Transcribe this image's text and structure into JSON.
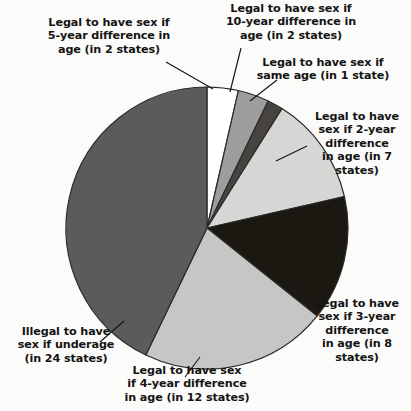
{
  "chart_data": {
    "type": "pie",
    "title": "",
    "subtitle": "",
    "xlabel": "",
    "ylabel": "",
    "legend_position": "none",
    "grid": false,
    "unit": "states",
    "total": 56,
    "center": {
      "cx": 207,
      "cy": 228,
      "r": 141
    },
    "start_angle_deg": 0,
    "direction": "clockwise",
    "categories": [
      "Legal to have sex if 5-year difference in age (in 2 states)",
      "Legal to have sex if 10-year difference in age (in 2 states)",
      "Legal to have sex if same age (in 1 state)",
      "Legal to have sex if 2-year difference in age (in 7 states)",
      "Legal to have sex if 3-year difference in age (in 8 states)",
      "Legal to have sex if 4-year difference in age (in 12 states)",
      "Illegal to have sex if underage (in 24 states)"
    ],
    "values": [
      2,
      2,
      1,
      7,
      8,
      12,
      24
    ],
    "slices": [
      {
        "key": "five-year",
        "label": "Legal to have sex if\n5-year difference in\nage (in 2 states)",
        "value": 2,
        "start_deg": 0,
        "end_deg": 12.86,
        "color": "#ffffff",
        "leader": {
          "x1": 166,
          "y1": 62,
          "x2": 213,
          "y2": 89
        }
      },
      {
        "key": "ten-year",
        "label": "Legal to have sex if\n10-year difference in\nage (in 2 states)",
        "value": 2,
        "start_deg": 12.86,
        "end_deg": 25.71,
        "color": "#9d9d9d",
        "leader": {
          "x1": 241,
          "y1": 48,
          "x2": 230,
          "y2": 92
        }
      },
      {
        "key": "same-age",
        "label": "Legal to have sex if\nsame age (in 1 state)",
        "value": 1,
        "start_deg": 25.71,
        "end_deg": 32.14,
        "color": "#474440",
        "leader": {
          "x1": 277,
          "y1": 80,
          "x2": 250,
          "y2": 101
        }
      },
      {
        "key": "two-year",
        "label": "Legal to have\nsex if 2-year\ndifference\nin age (in 7\nstates)",
        "value": 7,
        "start_deg": 32.14,
        "end_deg": 77.14,
        "color": "#d6d6d4",
        "leader": {
          "x1": 307,
          "y1": 146,
          "x2": 276,
          "y2": 161
        }
      },
      {
        "key": "three-year",
        "label": "Legal to have\nsex if 3-year\ndifference\nin age (in 8\nstates)",
        "value": 8,
        "start_deg": 77.14,
        "end_deg": 128.57,
        "color": "#1b1711",
        "leader": {
          "x1": 306,
          "y1": 295,
          "x2": 288,
          "y2": 275
        }
      },
      {
        "key": "four-year",
        "label": "Legal to have sex\nif 4-year difference\nin age (in 12 states)",
        "value": 12,
        "start_deg": 128.57,
        "end_deg": 205.71,
        "color": "#c6c6c4",
        "leader": {
          "x1": 185,
          "y1": 377,
          "x2": 200,
          "y2": 357
        }
      },
      {
        "key": "illegal",
        "label": "Illegal to have\nsex if underage\n(in 24 states)",
        "value": 24,
        "start_deg": 205.71,
        "end_deg": 360,
        "color": "#5b5b59",
        "leader": {
          "x1": 100,
          "y1": 342,
          "x2": 124,
          "y2": 321
        }
      }
    ],
    "colors": {
      "five_year": "#ffffff",
      "ten_year": "#9d9d9d",
      "same_age": "#474440",
      "two_year": "#d6d6d4",
      "three_year": "#1b1711",
      "four_year": "#c6c6c4",
      "illegal": "#5b5b59",
      "outline": "#2a2a2a",
      "text": "#131313",
      "background": "#fbfbf9"
    }
  }
}
